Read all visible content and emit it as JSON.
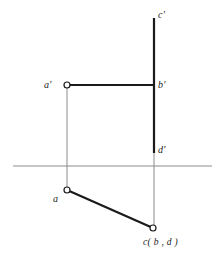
{
  "figure": {
    "type": "orthographic-projection-diagram",
    "width": 223,
    "height": 257,
    "background_color": "#ffffff",
    "line_color_heavy": "#1a1a1a",
    "line_color_light": "#8c8c8c",
    "marker_fill": "#ffffff",
    "labels": {
      "c_prime": "c'",
      "a_prime": "a'",
      "b_prime": "b'",
      "d_prime": "d'",
      "a": "a",
      "c_bd": "c( b , d )"
    },
    "label_positions": {
      "c_prime": {
        "x": 158,
        "y": 10
      },
      "a_prime": {
        "x": 44,
        "y": 80
      },
      "b_prime": {
        "x": 158,
        "y": 80
      },
      "d_prime": {
        "x": 158,
        "y": 145
      },
      "a": {
        "x": 53,
        "y": 194
      },
      "c_bd": {
        "x": 143,
        "y": 238
      }
    },
    "geometry": {
      "ground_line": {
        "x1": 13,
        "y1": 166,
        "x2": 212,
        "y2": 166,
        "weight": 1,
        "tone": "light"
      },
      "vertical_trace_cd": {
        "x1": 154,
        "y1": 18,
        "x2": 154,
        "y2": 153,
        "weight": 2.2,
        "tone": "heavy"
      },
      "horizontal_ab_prime": {
        "x1": 67,
        "y1": 85,
        "x2": 155,
        "y2": 85,
        "weight": 2.2,
        "tone": "heavy"
      },
      "oblique_ac": {
        "x1": 67,
        "y1": 190,
        "x2": 153,
        "y2": 228,
        "weight": 2.2,
        "tone": "heavy"
      },
      "projector_left": {
        "x1": 67,
        "y1": 85,
        "x2": 67,
        "y2": 190,
        "weight": 1,
        "tone": "light"
      },
      "projector_right": {
        "x1": 154,
        "y1": 153,
        "x2": 154,
        "y2": 228,
        "weight": 1,
        "tone": "light"
      }
    },
    "points": [
      {
        "name": "a-prime-point",
        "x": 67,
        "y": 85,
        "r": 3
      },
      {
        "name": "a-point",
        "x": 67,
        "y": 190,
        "r": 3
      },
      {
        "name": "c-point",
        "x": 153,
        "y": 228,
        "r": 3
      }
    ]
  }
}
